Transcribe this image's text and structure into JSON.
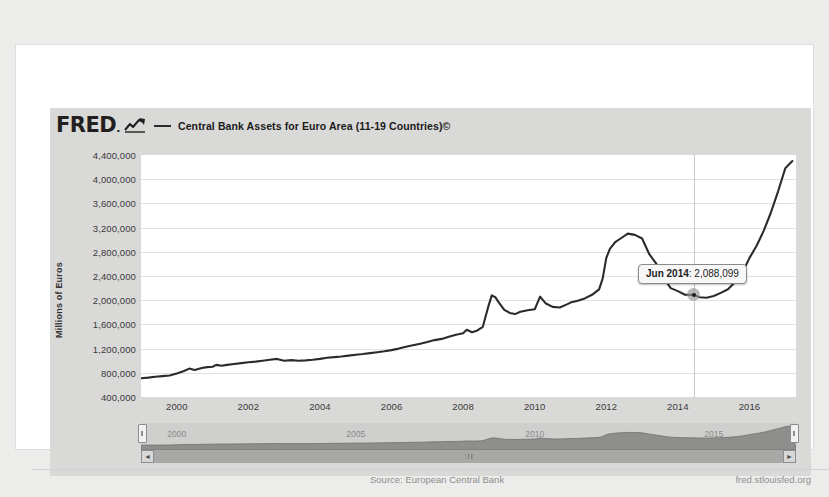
{
  "brand": {
    "logo_text": "FRED",
    "logo_dot": ".",
    "logo_mark": "trend-up-icon"
  },
  "legend": {
    "series_label": "Central Bank Assets for Euro Area (11-19 Countries)©",
    "swatch_color": "#2b2b2b"
  },
  "tooltip": {
    "date": "Jun 2014",
    "separator": ": ",
    "value": "2,088,099"
  },
  "footer": {
    "source": "Source: European Central Bank",
    "url": "fred.stlouisfed.org"
  },
  "navigator": {
    "years": [
      "2000",
      "2005",
      "2010",
      "2015"
    ],
    "left_handle": "nav-handle-left",
    "right_handle": "nav-handle-right",
    "scroll_left": "◄",
    "scroll_right": "►"
  },
  "chart_data": {
    "type": "line",
    "title": "Central Bank Assets for Euro Area (11-19 Countries)©",
    "xlabel": "",
    "ylabel": "Millions of Euros",
    "grid": true,
    "legend_position": "top",
    "source": "European Central Bank",
    "ylim": [
      400000,
      4400000
    ],
    "yticks": [
      4400000,
      4000000,
      3600000,
      3200000,
      2800000,
      2400000,
      2000000,
      1600000,
      1200000,
      800000,
      400000
    ],
    "ytick_labels": [
      "4,400,000",
      "4,000,000",
      "3,600,000",
      "3,200,000",
      "2,800,000",
      "2,400,000",
      "2,000,000",
      "1,600,000",
      "1,200,000",
      "800,000",
      "400,000"
    ],
    "xlim": [
      1999.0,
      2017.3
    ],
    "xticks": [
      2000,
      2002,
      2004,
      2006,
      2008,
      2010,
      2012,
      2014,
      2016
    ],
    "xtick_labels": [
      "2000",
      "2002",
      "2004",
      "2006",
      "2008",
      "2010",
      "2012",
      "2014",
      "2016"
    ],
    "highlight_point": {
      "x": 2014.45,
      "y": 2088099,
      "label": "Jun 2014: 2,088,099"
    },
    "series": [
      {
        "name": "Central Bank Assets for Euro Area (11-19 Countries)©",
        "color": "#2b2b2b",
        "x": [
          1999.0,
          1999.2,
          1999.4,
          1999.6,
          1999.8,
          2000.0,
          2000.2,
          2000.35,
          2000.5,
          2000.7,
          2000.85,
          2001.0,
          2001.1,
          2001.25,
          2001.4,
          2001.6,
          2001.8,
          2002.0,
          2002.2,
          2002.4,
          2002.6,
          2002.8,
          2003.0,
          2003.2,
          2003.4,
          2003.6,
          2003.8,
          2004.0,
          2004.2,
          2004.4,
          2004.6,
          2004.8,
          2005.0,
          2005.2,
          2005.4,
          2005.6,
          2005.8,
          2006.0,
          2006.2,
          2006.4,
          2006.6,
          2006.8,
          2007.0,
          2007.2,
          2007.4,
          2007.6,
          2007.8,
          2008.0,
          2008.1,
          2008.25,
          2008.4,
          2008.55,
          2008.7,
          2008.8,
          2008.9,
          2009.0,
          2009.15,
          2009.3,
          2009.45,
          2009.6,
          2009.8,
          2010.0,
          2010.15,
          2010.3,
          2010.5,
          2010.7,
          2010.9,
          2011.0,
          2011.2,
          2011.4,
          2011.6,
          2011.8,
          2011.9,
          2012.0,
          2012.1,
          2012.25,
          2012.4,
          2012.6,
          2012.8,
          2013.0,
          2013.2,
          2013.4,
          2013.6,
          2013.8,
          2014.0,
          2014.2,
          2014.45,
          2014.6,
          2014.8,
          2015.0,
          2015.2,
          2015.4,
          2015.6,
          2015.8,
          2016.0,
          2016.2,
          2016.4,
          2016.6,
          2016.8,
          2017.0,
          2017.2
        ],
        "y": [
          710000,
          720000,
          735000,
          745000,
          755000,
          790000,
          830000,
          870000,
          845000,
          880000,
          895000,
          900000,
          930000,
          915000,
          930000,
          945000,
          960000,
          975000,
          985000,
          1000000,
          1015000,
          1030000,
          1000000,
          1010000,
          1000000,
          1005000,
          1015000,
          1030000,
          1050000,
          1060000,
          1070000,
          1085000,
          1100000,
          1110000,
          1125000,
          1140000,
          1155000,
          1175000,
          1200000,
          1230000,
          1255000,
          1280000,
          1310000,
          1340000,
          1360000,
          1395000,
          1430000,
          1455000,
          1510000,
          1470000,
          1500000,
          1560000,
          1890000,
          2080000,
          2050000,
          1960000,
          1840000,
          1790000,
          1770000,
          1810000,
          1835000,
          1850000,
          2060000,
          1950000,
          1890000,
          1880000,
          1930000,
          1960000,
          1990000,
          2030000,
          2090000,
          2180000,
          2360000,
          2700000,
          2850000,
          2960000,
          3020000,
          3100000,
          3080000,
          3020000,
          2760000,
          2600000,
          2370000,
          2200000,
          2150000,
          2090000,
          2088099,
          2050000,
          2040000,
          2070000,
          2120000,
          2180000,
          2300000,
          2450000,
          2700000,
          2900000,
          3150000,
          3450000,
          3800000,
          4180000,
          4300000
        ]
      }
    ]
  }
}
